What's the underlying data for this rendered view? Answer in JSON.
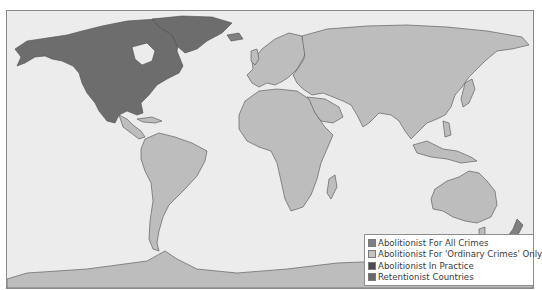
{
  "map": {
    "type": "world-choropleth",
    "ocean_color": "#ececec",
    "border_color": "#555555",
    "categories": {
      "abolitionist_all": "#7f7f7f",
      "abolitionist_ordinary": "#bdbdbd",
      "abolitionist_practice": "#4a4a4a",
      "retentionist": "#6a6a6a"
    }
  },
  "legend": {
    "items": [
      {
        "label": "Abolitionist For All Crimes",
        "color": "#7f7f7f"
      },
      {
        "label": "Abolitionist For 'Ordinary Crimes' Only",
        "color": "#c3c3c3"
      },
      {
        "label": "Abolitionist In Practice",
        "color": "#4b4b4b"
      },
      {
        "label": "Retentionist Countries",
        "color": "#6a6a6a"
      }
    ]
  }
}
